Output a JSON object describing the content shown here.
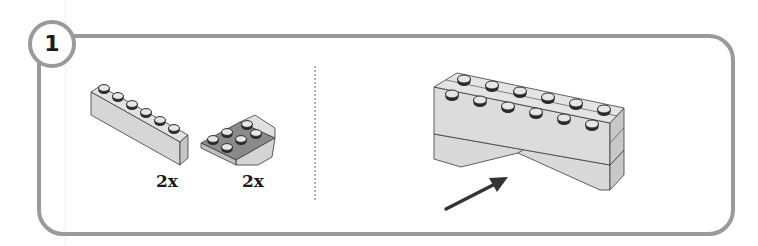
{
  "step": {
    "number": "1"
  },
  "parts_list": [
    {
      "part": "1x6 brick",
      "icon": "brick-1x6-icon",
      "quantity": "2x"
    },
    {
      "part": "inverted slope 2x2",
      "icon": "inverted-slope-icon",
      "quantity": "2x"
    }
  ],
  "assembly": {
    "icon": "assembled-bricks-icon",
    "indicator": "arrow-icon"
  },
  "colors": {
    "frame": "#9a9a9a",
    "brick_fill": "#d8d8d8",
    "brick_shade": "#c4c4c4",
    "outline": "#3a3a3a",
    "stud_dark": "#2a2a2a",
    "arrow": "#333333"
  }
}
